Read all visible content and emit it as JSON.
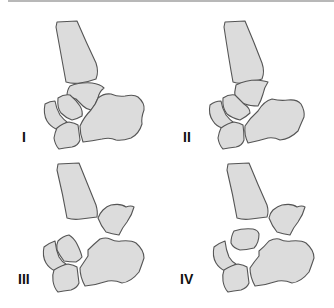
{
  "figure": {
    "colors": {
      "bone_fill": "#dcdcdc",
      "bone_stroke": "#555555",
      "label": "#111111",
      "background": "#ffffff"
    },
    "panels": [
      {
        "id": "I",
        "label": "I"
      },
      {
        "id": "II",
        "label": "II"
      },
      {
        "id": "III",
        "label": "III"
      },
      {
        "id": "IV",
        "label": "IV"
      }
    ]
  }
}
